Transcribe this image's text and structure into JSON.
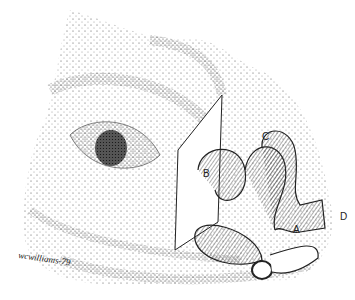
{
  "figure": {
    "labels": {
      "a": "A",
      "b": "B",
      "c": "C",
      "d": "D"
    },
    "signature": "wcwilliams-79",
    "colors": {
      "ink": "#222222",
      "background": "#ffffff"
    }
  }
}
